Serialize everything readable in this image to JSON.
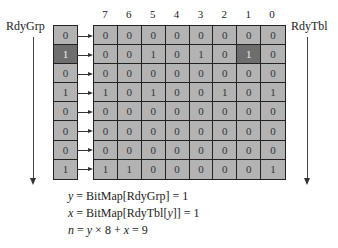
{
  "labels": {
    "rdygrp": "RdyGrp",
    "rdytbl": "RdyTbl"
  },
  "column_headers": [
    "7",
    "6",
    "5",
    "4",
    "3",
    "2",
    "1",
    "0"
  ],
  "rdygrp": {
    "values": [
      "0",
      "1",
      "0",
      "1",
      "0",
      "0",
      "0",
      "1"
    ],
    "highlighted_index": 1
  },
  "rdytbl": {
    "rows": [
      [
        "0",
        "0",
        "0",
        "0",
        "0",
        "0",
        "0",
        "0"
      ],
      [
        "0",
        "0",
        "1",
        "0",
        "1",
        "0",
        "1",
        "0"
      ],
      [
        "0",
        "0",
        "0",
        "0",
        "0",
        "0",
        "0",
        "0"
      ],
      [
        "1",
        "0",
        "1",
        "0",
        "0",
        "1",
        "0",
        "1"
      ],
      [
        "0",
        "0",
        "0",
        "0",
        "0",
        "0",
        "0",
        "0"
      ],
      [
        "0",
        "0",
        "0",
        "0",
        "0",
        "0",
        "0",
        "0"
      ],
      [
        "0",
        "0",
        "0",
        "0",
        "0",
        "0",
        "0",
        "0"
      ],
      [
        "1",
        "1",
        "0",
        "0",
        "0",
        "0",
        "0",
        "1"
      ]
    ],
    "highlighted_cell": {
      "row": 1,
      "col": 6
    }
  },
  "formulas": [
    "y = BitMap[RdyGrp] = 1",
    "x = BitMap[RdyTbl[y]] = 1",
    "n = y × 8 + x = 9"
  ],
  "colors": {
    "cell": "#b3b3b3",
    "highlight": "#6e6e6e",
    "border": "#222222"
  }
}
